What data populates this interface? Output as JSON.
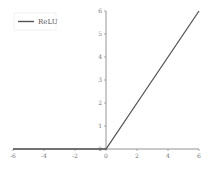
{
  "chart_data": {
    "type": "line",
    "title": "",
    "xlabel": "",
    "ylabel": "",
    "xlim": [
      -6,
      6
    ],
    "ylim": [
      0,
      6
    ],
    "grid": false,
    "legend_position": "upper left",
    "x_ticks": [
      "-6",
      "-4",
      "-2",
      "0",
      "2",
      "4",
      "6"
    ],
    "y_ticks": [
      "0",
      "1",
      "2",
      "3",
      "4",
      "5",
      "6"
    ],
    "series": [
      {
        "name": "ReLU",
        "color": "#555555",
        "x": [
          -6,
          -4,
          -2,
          0,
          2,
          4,
          6
        ],
        "y": [
          0,
          0,
          0,
          0,
          2,
          4,
          6
        ]
      }
    ]
  },
  "legend": {
    "label": "ReLU"
  },
  "colors": {
    "line": "#555555",
    "axis": "#888888"
  }
}
